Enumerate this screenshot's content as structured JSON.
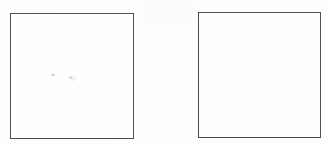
{
  "document": {
    "type": "scanned-worksheet",
    "title": "Two empty answer boxes",
    "background_color": "#fdfdfd",
    "width": 329,
    "height": 144
  },
  "boxes": [
    {
      "id": "box-left",
      "label": "left-answer-box",
      "content": "",
      "border_color": "#4a4a4a",
      "border_width": "1.5px",
      "fill_color": "#fefefe",
      "x": 10,
      "y": 13,
      "width": 124,
      "height": 126
    },
    {
      "id": "box-right",
      "label": "right-answer-box",
      "content": "",
      "border_color": "#4a4a4a",
      "border_width": "1.5px",
      "fill_color": "#fefefe",
      "x": 198,
      "y": 12,
      "width": 123,
      "height": 126
    }
  ],
  "marks": [
    {
      "id": "speck-a",
      "kind": "faint-pencil-speck",
      "x": 51,
      "y": 74,
      "color": "#6e6e78"
    },
    {
      "id": "speck-b",
      "kind": "faint-pencil-speck",
      "x": 69,
      "y": 76,
      "color": "#787882"
    },
    {
      "id": "speck-c",
      "kind": "faint-smudge",
      "x": 70,
      "y": 75,
      "color": "#8c8c96"
    }
  ]
}
